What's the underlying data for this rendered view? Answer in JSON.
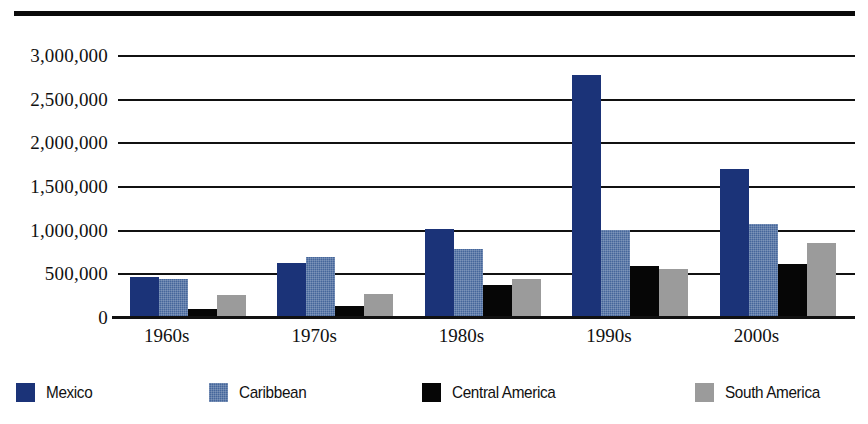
{
  "chart_data": {
    "type": "bar",
    "title": "",
    "subtitle": "",
    "xlabel": "",
    "ylabel": "",
    "grid": true,
    "legend_position": "bottom",
    "ylim": [
      0,
      3000000
    ],
    "ytick_step": 500000,
    "categories": [
      "1960s",
      "1970s",
      "1980s",
      "1990s",
      "2000s"
    ],
    "ytick_labels": [
      "3,000,000",
      "2,500,000",
      "2,000,000",
      "1,500,000",
      "1,000,000",
      "500,000",
      "0"
    ],
    "ytick_values": [
      3000000,
      2500000,
      2000000,
      1500000,
      1000000,
      500000,
      0
    ],
    "series": [
      {
        "name": "Mexico",
        "color": "#1b3378",
        "values": [
          455000,
          620000,
          1010000,
          2770000,
          1700000
        ]
      },
      {
        "name": "Caribbean",
        "color": "#45669b",
        "values": [
          430000,
          690000,
          780000,
          1000000,
          1070000
        ]
      },
      {
        "name": "Central America",
        "color": "#060606",
        "values": [
          95000,
          125000,
          370000,
          580000,
          610000
        ]
      },
      {
        "name": "South America",
        "color": "#9b9b9b",
        "values": [
          250000,
          260000,
          440000,
          550000,
          850000
        ]
      }
    ]
  },
  "legend": {
    "items": [
      {
        "label": "Mexico",
        "color": "#1b3378"
      },
      {
        "label": "Caribbean",
        "color": "#45669b"
      },
      {
        "label": "Central America",
        "color": "#060606"
      },
      {
        "label": "South America",
        "color": "#9b9b9b"
      }
    ]
  }
}
